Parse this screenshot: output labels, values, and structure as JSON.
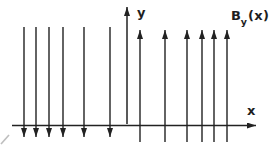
{
  "figure": {
    "background": "#ffffff",
    "ink_color": "#222222",
    "artifact_color": "#8a8a8a",
    "labels": {
      "y_axis": "y",
      "x_axis": "x",
      "field_base": "B",
      "field_subscript": "y",
      "field_argument": "(x)"
    },
    "axes": {
      "x_axis": {
        "y": 125.5,
        "x_start": 12,
        "x_tip": 256
      },
      "y_axis": {
        "x": 127,
        "y_bottom": 124,
        "y_tip": 7
      }
    },
    "field_arrows": {
      "down": {
        "direction": "down",
        "x_positions": [
          24,
          36,
          49,
          63,
          84,
          110
        ],
        "y_tail": 27,
        "y_tip": 137
      },
      "up": {
        "direction": "up",
        "x_positions": [
          140,
          165,
          187,
          202,
          214,
          227
        ],
        "y_tail": 142,
        "y_tip": 30
      }
    },
    "scan_artifact": {
      "x1": 1,
      "y1": 144,
      "x2": 9,
      "y2": 135
    }
  }
}
